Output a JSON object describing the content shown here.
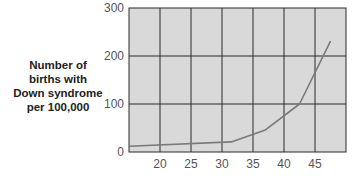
{
  "chart_data": {
    "type": "line",
    "title": "",
    "xlabel": "",
    "ylabel_lines": [
      "Number of",
      "births with",
      "Down syndrome",
      "per 100,000"
    ],
    "ylabel": "Number of births with Down syndrome per 100,000",
    "xlim": [
      15,
      50
    ],
    "ylim": [
      0,
      300
    ],
    "x_ticks": [
      20,
      25,
      30,
      35,
      40,
      45
    ],
    "y_ticks": [
      0,
      100,
      200,
      300
    ],
    "grid": true,
    "legend": "none",
    "series": [
      {
        "name": "Down syndrome births",
        "x": [
          15,
          31.5,
          37,
          42.5,
          47.5
        ],
        "y": [
          12,
          21,
          46,
          100,
          231
        ]
      }
    ],
    "colors": {
      "plot_background": "#d9d9d9",
      "grid": "#2b2b2b",
      "line": "#7a7a7a",
      "tick_text": "#555555",
      "label_text": "#222222"
    }
  }
}
